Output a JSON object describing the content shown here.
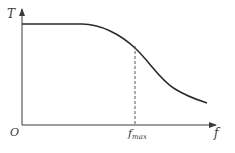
{
  "diagram": {
    "type": "line",
    "axes": {
      "y_label": "T",
      "x_label": "f",
      "origin_label": "O"
    },
    "marker": {
      "label_main": "f",
      "label_sub": "max",
      "style": "dashed"
    },
    "colors": {
      "line": "#2a2a2a",
      "axis": "#3a3a3a",
      "dashed": "#555555"
    }
  }
}
